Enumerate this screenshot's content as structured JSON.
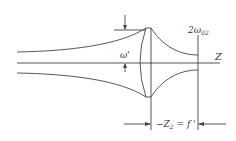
{
  "diagram": {
    "type": "gaussian-beam-focusing",
    "labels": {
      "waist_in": "ω'",
      "waist_out": "2ω",
      "waist_out_sub": "02",
      "axis": "Z",
      "distance": "−Z",
      "distance_sub": "2",
      "distance_eq": " = f '"
    },
    "colors": {
      "line": "#444444",
      "text": "#333333",
      "background": "#ffffff"
    }
  }
}
